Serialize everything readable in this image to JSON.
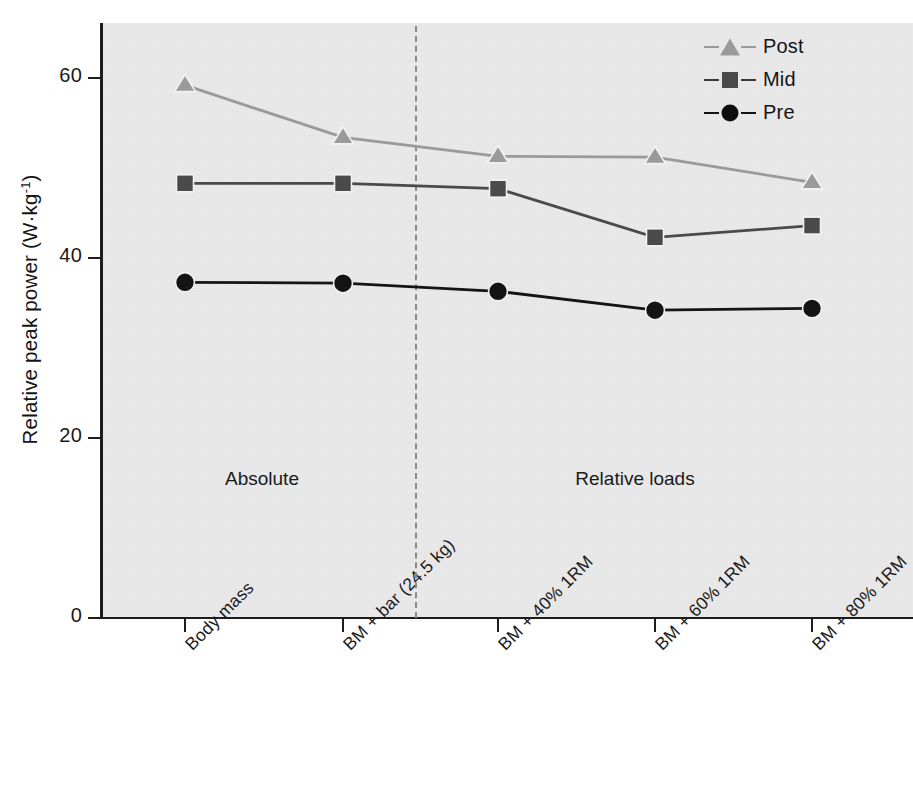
{
  "chart_data": {
    "type": "line",
    "title": "",
    "xlabel": "",
    "ylabel": "Relative peak power (W·kg-1)",
    "ylabel_text": "Relative peak power (W·kg",
    "ylabel_sup": "-1",
    "ylabel_tail": ")",
    "ylim": [
      0,
      67
    ],
    "yticks": [
      0,
      20,
      40,
      60
    ],
    "ytick_labels": [
      "0",
      "20",
      "40",
      "60"
    ],
    "grid": false,
    "categories": [
      "Body mass",
      "BM + bar (24.5 kg)",
      "BM + 40% 1RM",
      "BM + 60% 1RM",
      "BM + 80% 1RM"
    ],
    "series": [
      {
        "name": "Post",
        "marker": "triangle",
        "color": "#9a9a9a",
        "values": [
          59.2,
          53.4,
          51.3,
          51.2,
          48.4
        ]
      },
      {
        "name": "Mid",
        "marker": "square",
        "color": "#4a4a4a",
        "values": [
          48.3,
          48.3,
          47.7,
          42.3,
          43.6
        ]
      },
      {
        "name": "Pre",
        "marker": "circle",
        "color": "#141414",
        "values": [
          37.3,
          37.2,
          36.3,
          34.2,
          34.4
        ]
      }
    ],
    "annotations": [
      {
        "text": "Absolute",
        "x_category_between": 1.5
      },
      {
        "text": "Relative loads",
        "x_category_between": 4.0
      }
    ],
    "divider": {
      "style": "dashed",
      "color": "#8a8a8a"
    },
    "legend": {
      "position": "top-right",
      "entries": [
        {
          "label": "Post",
          "marker": "triangle",
          "color": "#9a9a9a"
        },
        {
          "label": "Mid",
          "marker": "square",
          "color": "#4a4a4a"
        },
        {
          "label": "Pre",
          "marker": "circle",
          "color": "#141414"
        }
      ]
    },
    "plot_background": "#e8e8e8"
  }
}
